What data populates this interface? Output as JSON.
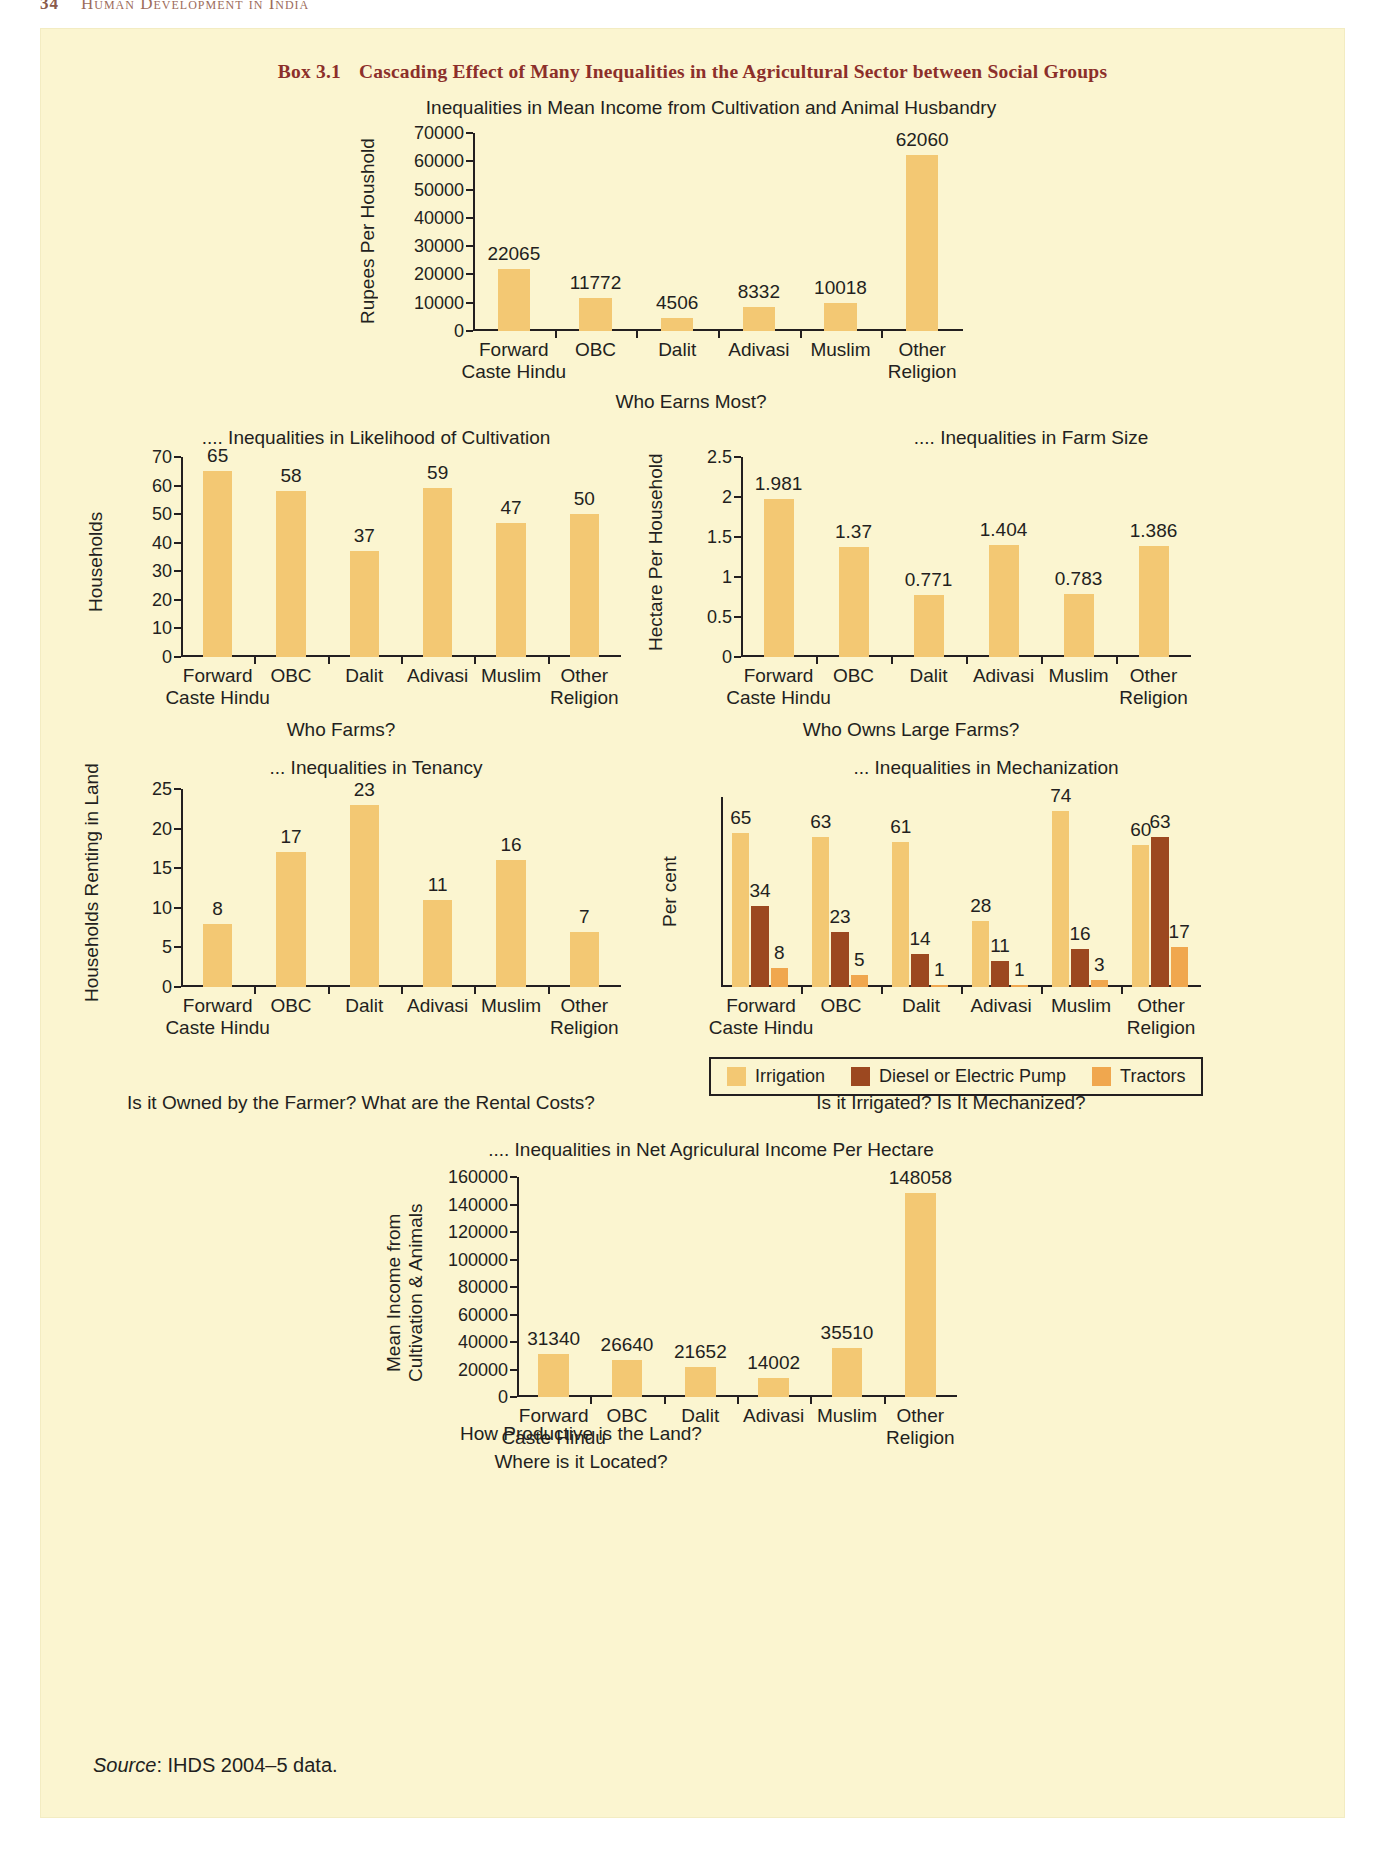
{
  "page_header": {
    "page_number": "34",
    "running_title": "Human Development in India"
  },
  "box": {
    "label": "Box 3.1",
    "title": "Cascading Effect of Many Inequalities in the Agricultural Sector between Social Groups"
  },
  "source": {
    "prefix": "Source",
    "text": ": IHDS 2004–5 data."
  },
  "legend": {
    "irrigation": "Irrigation",
    "pump": "Diesel or Electric Pump",
    "tractors": "Tractors"
  },
  "colors": {
    "page_background": "#ffffff",
    "box_background": "#fbf5d0",
    "title_red": "#8c2f2a",
    "irrigation": "#f3c873",
    "pump": "#9c4820",
    "tractors": "#f0a74e",
    "text": "#231f20"
  },
  "chart_data": [
    {
      "id": "income",
      "type": "bar",
      "title": "Inequalities in Mean Income from Cultivation and Animal Husbandry",
      "caption": "Who Earns Most?",
      "ylabel": "Rupees Per Houshold",
      "xlabel": "",
      "categories": [
        "Forward Caste Hindu",
        "OBC",
        "Dalit",
        "Adivasi",
        "Muslim",
        "Other Religion"
      ],
      "values": [
        22065,
        11772,
        4506,
        8332,
        10018,
        62060
      ],
      "value_labels": [
        "22065",
        "11772",
        "4506",
        "8332",
        "10018",
        "62060"
      ],
      "yticks": [
        0,
        10000,
        20000,
        30000,
        40000,
        50000,
        60000,
        70000
      ],
      "ytick_labels": [
        "0",
        "10000",
        "20000",
        "30000",
        "40000",
        "50000",
        "60000",
        "70000"
      ],
      "ylim": [
        0,
        70000
      ],
      "grid": false,
      "legend": false
    },
    {
      "id": "cultivation",
      "type": "bar",
      "title": ".... Inequalities in Likelihood of Cultivation",
      "caption": "Who Farms?",
      "ylabel": "Households",
      "xlabel": "",
      "categories": [
        "Forward Caste Hindu",
        "OBC",
        "Dalit",
        "Adivasi",
        "Muslim",
        "Other Religion"
      ],
      "values": [
        65,
        58,
        37,
        59,
        47,
        50
      ],
      "value_labels": [
        "65",
        "58",
        "37",
        "59",
        "47",
        "50"
      ],
      "yticks": [
        0,
        10,
        20,
        30,
        40,
        50,
        60,
        70
      ],
      "ytick_labels": [
        "0",
        "10",
        "20",
        "30",
        "40",
        "50",
        "60",
        "70"
      ],
      "ylim": [
        0,
        70
      ],
      "grid": false,
      "legend": false
    },
    {
      "id": "farmsize",
      "type": "bar",
      "title": ".... Inequalities in Farm Size",
      "caption": "Who Owns Large Farms?",
      "ylabel": "Hectare Per Household",
      "xlabel": "",
      "categories": [
        "Forward Caste Hindu",
        "OBC",
        "Dalit",
        "Adivasi",
        "Muslim",
        "Other Religion"
      ],
      "values": [
        1.981,
        1.37,
        0.771,
        1.404,
        0.783,
        1.386
      ],
      "value_labels": [
        "1.981",
        "1.37",
        "0.771",
        "1.404",
        "0.783",
        "1.386"
      ],
      "yticks": [
        0,
        0.5,
        1,
        1.5,
        2,
        2.5
      ],
      "ytick_labels": [
        "0",
        "0.5",
        "1",
        "1.5",
        "2",
        "2.5"
      ],
      "ylim": [
        0,
        2.5
      ],
      "grid": false,
      "legend": false
    },
    {
      "id": "tenancy",
      "type": "bar",
      "title": "... Inequalities in Tenancy",
      "caption": "Is it Owned by the Farmer? What are the Rental Costs?",
      "ylabel": "Households Renting in Land",
      "xlabel": "",
      "categories": [
        "Forward Caste Hindu",
        "OBC",
        "Dalit",
        "Adivasi",
        "Muslim",
        "Other Religion"
      ],
      "values": [
        8,
        17,
        23,
        11,
        16,
        7
      ],
      "value_labels": [
        "8",
        "17",
        "23",
        "11",
        "16",
        "7"
      ],
      "yticks": [
        0,
        5,
        10,
        15,
        20,
        25
      ],
      "ytick_labels": [
        "0",
        "5",
        "10",
        "15",
        "20",
        "25"
      ],
      "ylim": [
        0,
        25
      ],
      "grid": false,
      "legend": false
    },
    {
      "id": "mechanization",
      "type": "bar",
      "title": "... Inequalities in Mechanization",
      "caption": "Is it Irrigated? Is It Mechanized?",
      "ylabel": "Per cent",
      "xlabel": "",
      "categories": [
        "Forward Caste Hindu",
        "OBC",
        "Dalit",
        "Adivasi",
        "Muslim",
        "Other Religion"
      ],
      "series": [
        {
          "name": "Irrigation",
          "values": [
            65,
            63,
            61,
            28,
            74,
            60
          ],
          "value_labels": [
            "65",
            "63",
            "61",
            "28",
            "74",
            "60"
          ]
        },
        {
          "name": "Diesel or Electric Pump",
          "values": [
            34,
            23,
            14,
            11,
            16,
            63
          ],
          "value_labels": [
            "34",
            "23",
            "14",
            "11",
            "16",
            "63"
          ]
        },
        {
          "name": "Tractors",
          "values": [
            8,
            5,
            1,
            1,
            3,
            17
          ],
          "value_labels": [
            "8",
            "5",
            "1",
            "1",
            "3",
            "17"
          ]
        }
      ],
      "ylim": [
        0,
        80
      ],
      "grid": false,
      "legend": true,
      "legend_position": "bottom"
    },
    {
      "id": "netincome",
      "type": "bar",
      "title": ".... Inequalities in Net Agriculural Income Per Hectare",
      "caption": "How Productive is the Land?",
      "caption2": "Where is it Located?",
      "ylabel": "Mean Income from Cultivation & Animals",
      "xlabel": "",
      "categories": [
        "Forward Caste Hindu",
        "OBC",
        "Dalit",
        "Adivasi",
        "Muslim",
        "Other Religion"
      ],
      "values": [
        31340,
        26640,
        21652,
        14002,
        35510,
        148058
      ],
      "value_labels": [
        "31340",
        "26640",
        "21652",
        "14002",
        "35510",
        "148058"
      ],
      "yticks": [
        0,
        20000,
        40000,
        60000,
        80000,
        100000,
        120000,
        140000,
        160000
      ],
      "ytick_labels": [
        "0",
        "20000",
        "40000",
        "60000",
        "80000",
        "100000",
        "120000",
        "140000",
        "160000"
      ],
      "ylim": [
        0,
        160000
      ],
      "grid": false,
      "legend": false
    }
  ]
}
